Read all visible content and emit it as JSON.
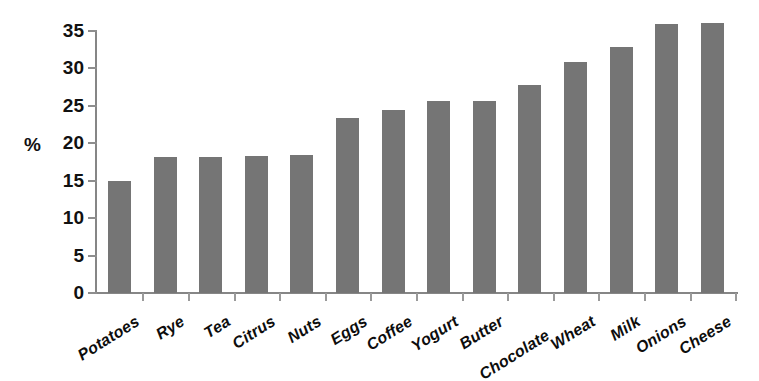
{
  "chart_data": {
    "type": "bar",
    "title": "",
    "subtitle": "",
    "xlabel": "",
    "ylabel": "%",
    "ylim": [
      0,
      35
    ],
    "yticks": [
      0,
      5,
      10,
      15,
      20,
      25,
      30,
      35
    ],
    "ytick_labels": [
      "0",
      "5",
      "10",
      "15",
      "20",
      "25",
      "30",
      "35"
    ],
    "grid": false,
    "legend": null,
    "bar_color": "#757575",
    "axis_color": "#868686",
    "categories": [
      "Potatoes",
      "Rye",
      "Tea",
      "Citrus",
      "Nuts",
      "Eggs",
      "Coffee",
      "Yogurt",
      "Butter",
      "Chocolate",
      "Wheat",
      "Milk",
      "Onions",
      "Cheese"
    ],
    "values": [
      15.0,
      18.2,
      18.2,
      18.3,
      18.4,
      23.4,
      24.5,
      25.6,
      25.7,
      27.8,
      30.8,
      32.9,
      36.0,
      36.1
    ]
  }
}
